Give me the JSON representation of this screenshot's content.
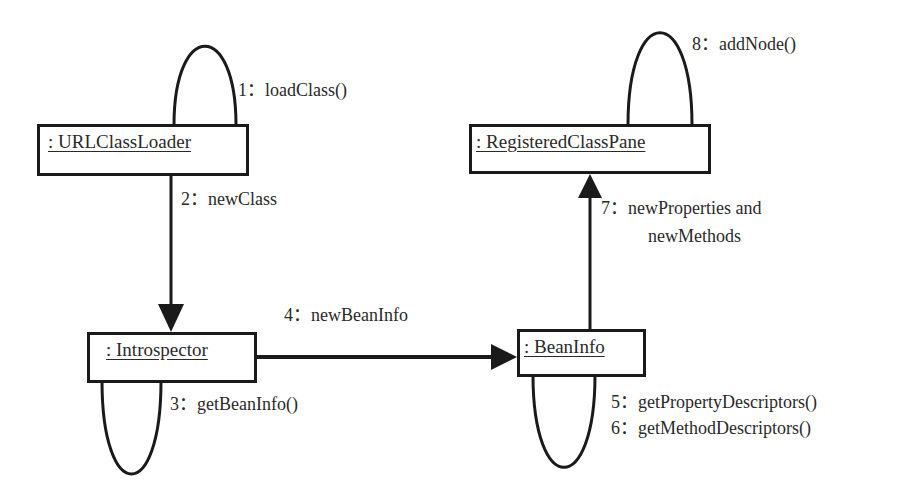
{
  "diagram": {
    "type": "UML collaboration diagram",
    "objects": [
      {
        "id": "urlclassloader",
        "label": ": URLClassLoader"
      },
      {
        "id": "registeredclasspane",
        "label": ": RegisteredClassPane"
      },
      {
        "id": "introspector",
        "label": ": Introspector"
      },
      {
        "id": "beaninfo",
        "label": ": BeanInfo"
      }
    ],
    "messages": [
      {
        "seq": "1",
        "label": "1：loadClass()",
        "from": "urlclassloader",
        "to": "urlclassloader"
      },
      {
        "seq": "2",
        "label": "2：newClass",
        "from": "urlclassloader",
        "to": "introspector"
      },
      {
        "seq": "3",
        "label": "3：getBeanInfo()",
        "from": "introspector",
        "to": "introspector"
      },
      {
        "seq": "4",
        "label": "4：newBeanInfo",
        "from": "introspector",
        "to": "beaninfo"
      },
      {
        "seq": "5",
        "label": "5：getPropertyDescriptors()",
        "from": "beaninfo",
        "to": "beaninfo"
      },
      {
        "seq": "6",
        "label": "6：getMethodDescriptors()",
        "from": "beaninfo",
        "to": "beaninfo"
      },
      {
        "seq": "7",
        "label_line1": "7：newProperties and",
        "label_line2": "newMethods",
        "from": "beaninfo",
        "to": "registeredclasspane"
      },
      {
        "seq": "8",
        "label": "8：addNode()",
        "from": "registeredclasspane",
        "to": "registeredclasspane"
      }
    ],
    "colors": {
      "line": "#1a1a1a",
      "text": "#2a2a2a",
      "background": "#ffffff"
    }
  }
}
